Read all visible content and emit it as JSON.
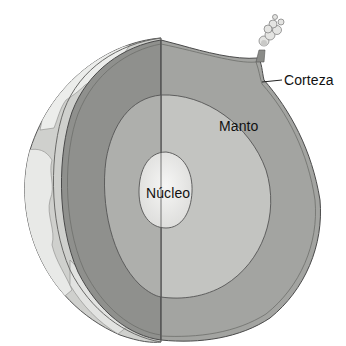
{
  "diagram": {
    "labels": {
      "crust": "Corteza",
      "mantle": "Manto",
      "core": "Núcleo"
    },
    "colors": {
      "surface_land": "#e6e6e4",
      "surface_ocean": "#c8c9c6",
      "crust_outline": "#5a5a5a",
      "left_cut_face": "#8f908d",
      "right_cut_face": "#a3a4a1",
      "mantle": "#c3c4c1",
      "core": "#e9e9e7",
      "label_text": "#111111"
    }
  }
}
